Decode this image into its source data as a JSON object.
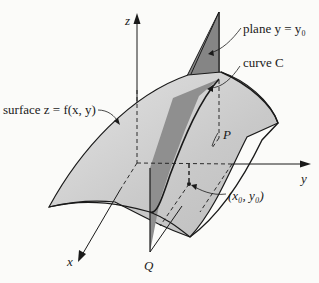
{
  "figure": {
    "axes": {
      "x_label": "x",
      "y_label": "y",
      "z_label": "z"
    },
    "labels": {
      "surface": "surface z = f(x, y)",
      "plane": "plane y = y₀",
      "curve": "curve C",
      "point_p": "P",
      "point_q": "Q",
      "base_point": "(x₀, y₀)"
    },
    "colors": {
      "surface_fill": "#d2d2d2",
      "plane_fill": "#8a8a8a",
      "outline": "#1a1a1a",
      "background": "#fbfbf9"
    }
  }
}
